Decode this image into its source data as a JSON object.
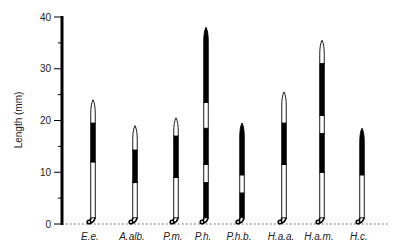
{
  "chart_data": {
    "type": "bar",
    "title": "",
    "xlabel": "",
    "ylabel": "Length (mm)",
    "ylim": [
      0,
      40
    ],
    "yticks": [
      0,
      10,
      20,
      30,
      40
    ],
    "grid": false,
    "legend": null,
    "categories": [
      "E.e.",
      "A.alb.",
      "P.m.",
      "P.h.",
      "P.h.b.",
      "H.a.a.",
      "H.a.m.",
      "H.c."
    ],
    "values": [
      24,
      19,
      20.5,
      38,
      19.5,
      25.5,
      35.5,
      18.5
    ],
    "bands": [
      [
        {
          "from": 0,
          "to": 12,
          "color": "white"
        },
        {
          "from": 12,
          "to": 19.5,
          "color": "black"
        },
        {
          "from": 19.5,
          "to": 24,
          "color": "white"
        }
      ],
      [
        {
          "from": 0,
          "to": 8,
          "color": "white"
        },
        {
          "from": 8,
          "to": 14.3,
          "color": "black"
        },
        {
          "from": 14.3,
          "to": 19,
          "color": "white"
        }
      ],
      [
        {
          "from": 0,
          "to": 9,
          "color": "white"
        },
        {
          "from": 9,
          "to": 17,
          "color": "black"
        },
        {
          "from": 17,
          "to": 20.5,
          "color": "white"
        }
      ],
      [
        {
          "from": 0,
          "to": 8,
          "color": "black"
        },
        {
          "from": 8,
          "to": 11.5,
          "color": "white"
        },
        {
          "from": 11.5,
          "to": 18.5,
          "color": "black"
        },
        {
          "from": 18.5,
          "to": 23.5,
          "color": "white"
        },
        {
          "from": 23.5,
          "to": 38,
          "color": "black"
        }
      ],
      [
        {
          "from": 0,
          "to": 6,
          "color": "black"
        },
        {
          "from": 6,
          "to": 9.5,
          "color": "white"
        },
        {
          "from": 9.5,
          "to": 19.5,
          "color": "black"
        }
      ],
      [
        {
          "from": 0,
          "to": 11.5,
          "color": "white"
        },
        {
          "from": 11.5,
          "to": 19.5,
          "color": "black"
        },
        {
          "from": 19.5,
          "to": 25.5,
          "color": "white"
        }
      ],
      [
        {
          "from": 0,
          "to": 10,
          "color": "white"
        },
        {
          "from": 10,
          "to": 17.5,
          "color": "black"
        },
        {
          "from": 17.5,
          "to": 21,
          "color": "white"
        },
        {
          "from": 21,
          "to": 31,
          "color": "black"
        },
        {
          "from": 31,
          "to": 35.5,
          "color": "white"
        }
      ],
      [
        {
          "from": 0,
          "to": 9.5,
          "color": "white"
        },
        {
          "from": 9.5,
          "to": 18.5,
          "color": "black"
        }
      ]
    ],
    "x_positions_px": [
      93,
      135,
      176,
      206,
      242,
      284,
      322,
      362
    ]
  },
  "axis": {
    "ylabel": "Length (mm)",
    "ticks": [
      "0",
      "10",
      "20",
      "30",
      "40"
    ]
  }
}
